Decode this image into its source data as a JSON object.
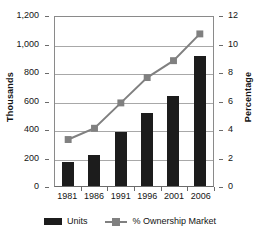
{
  "chart_data": {
    "type": "bar",
    "title": "",
    "xlabel": "",
    "ylabel": "Thousands",
    "y2label": "Percentage",
    "categories": [
      "1981",
      "1986",
      "1991",
      "1996",
      "2001",
      "2006"
    ],
    "series": [
      {
        "name": "Units",
        "type": "bar",
        "axis": "left",
        "color": "#1c1c1c",
        "values": [
          170,
          218,
          380,
          510,
          630,
          915
        ]
      },
      {
        "name": "% Ownership Market",
        "type": "line",
        "axis": "right",
        "color": "#808080",
        "marker": "square",
        "values": [
          3.3,
          4.1,
          5.9,
          7.7,
          8.9,
          10.8
        ]
      }
    ],
    "ylim": [
      0,
      1200
    ],
    "y2lim": [
      0,
      12
    ],
    "yticks": [
      "0",
      "200",
      "400",
      "600",
      "800",
      "1,000",
      "1,200"
    ],
    "ytick_values": [
      0,
      200,
      400,
      600,
      800,
      1000,
      1200
    ],
    "y2ticks": [
      "0",
      "2",
      "4",
      "6",
      "8",
      "10",
      "12"
    ],
    "y2tick_values": [
      0,
      2,
      4,
      6,
      8,
      10,
      12
    ],
    "grid": true,
    "legend_position": "bottom",
    "legend": [
      "Units",
      "% Ownership Market"
    ]
  }
}
